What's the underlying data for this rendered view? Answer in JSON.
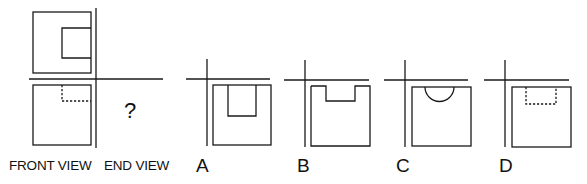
{
  "puzzle": {
    "question_mark": "?",
    "front_view_label": "FRONT VIEW",
    "end_view_label": "END VIEW",
    "options": [
      {
        "label": "A",
        "shape": "square with rectangular slot from top, deep"
      },
      {
        "label": "B",
        "shape": "square with shallow rectangular notch on top edge"
      },
      {
        "label": "C",
        "shape": "square with semicircular notch on top edge"
      },
      {
        "label": "D",
        "shape": "square with hidden (dashed) rectangular pocket near top"
      }
    ]
  },
  "colors": {
    "line": "#1a1a1a",
    "background": "#ffffff"
  }
}
